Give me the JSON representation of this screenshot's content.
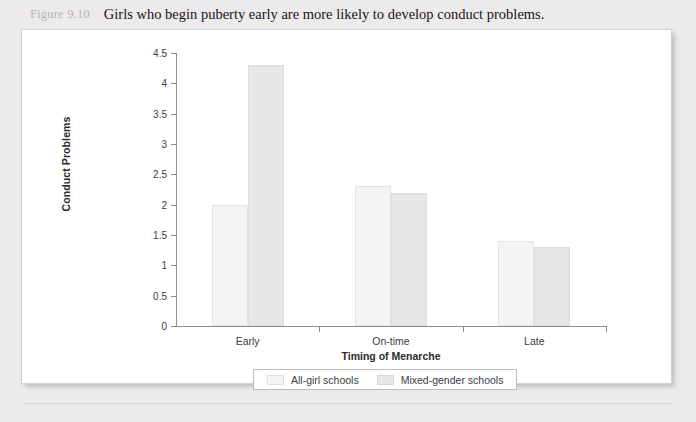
{
  "caption": {
    "figure_label": "Figure 9.10",
    "text": "Girls who begin puberty early are more likely to develop conduct problems."
  },
  "chart_data": {
    "type": "bar",
    "title": "",
    "categories": [
      "Early",
      "On-time",
      "Late"
    ],
    "series": [
      {
        "name": "All-girl schools",
        "values": [
          2.0,
          2.3,
          1.4
        ],
        "color": "#f4f4f4"
      },
      {
        "name": "Mixed-gender schools",
        "values": [
          4.3,
          2.2,
          1.3
        ],
        "color": "#e7e7e7"
      }
    ],
    "xlabel": "Timing of Menarche",
    "ylabel": "Conduct Problems",
    "ylim": [
      0,
      4.5
    ],
    "yticks": [
      "0",
      "0.5",
      "1",
      "1.5",
      "2",
      "2.5",
      "3",
      "3.5",
      "4",
      "4.5"
    ],
    "grid": false,
    "legend_position": "bottom"
  }
}
